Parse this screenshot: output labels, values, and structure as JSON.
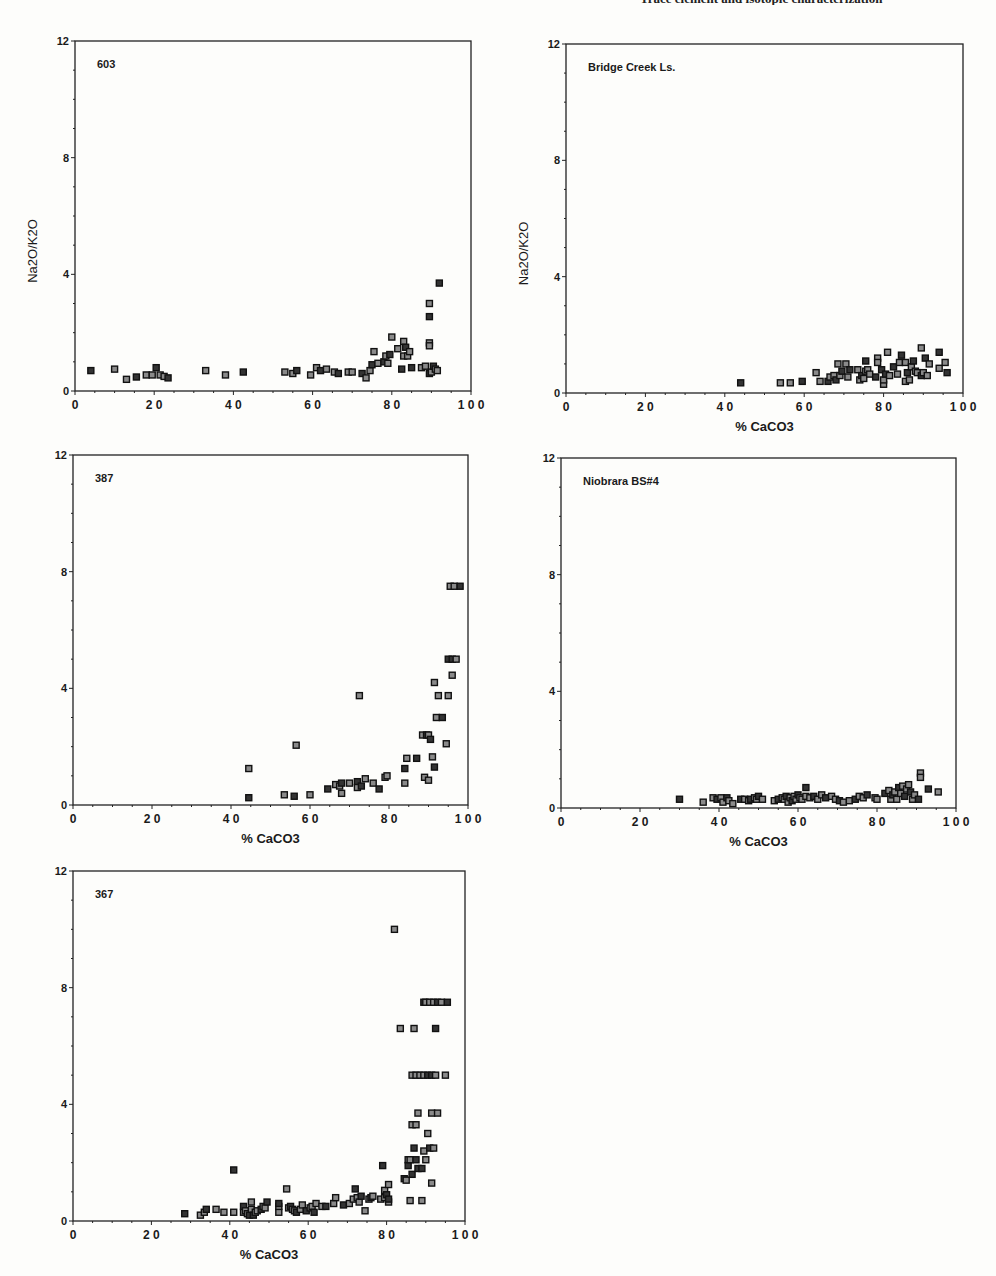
{
  "page": {
    "header_text": "Trace element and isotopic characterization"
  },
  "chart_data": [
    {
      "type": "scatter",
      "id": "plot-603",
      "title": "603",
      "xlabel": "% CaCO3",
      "ylabel": "Na2O/K2O",
      "xlim": [
        0,
        100
      ],
      "ylim": [
        0,
        12
      ],
      "xticks": [
        "0",
        "2 0",
        "4 0",
        "6 0",
        "8 0",
        "1 0 0"
      ],
      "yticks": [
        "0",
        "4",
        "8",
        "12"
      ],
      "show_xlabel": false,
      "show_ylabel": true,
      "box": {
        "left": 75,
        "top": 41,
        "right": 471,
        "bottom": 391
      },
      "points": [
        [
          4,
          0.7
        ],
        [
          10,
          0.75
        ],
        [
          13,
          0.4
        ],
        [
          15.5,
          0.48
        ],
        [
          18,
          0.55
        ],
        [
          19.5,
          0.55
        ],
        [
          20.5,
          0.8
        ],
        [
          21.5,
          0.55
        ],
        [
          22.5,
          0.5
        ],
        [
          23.5,
          0.45
        ],
        [
          33,
          0.7
        ],
        [
          38,
          0.55
        ],
        [
          42.5,
          0.65
        ],
        [
          53,
          0.65
        ],
        [
          55,
          0.6
        ],
        [
          56,
          0.7
        ],
        [
          59.5,
          0.55
        ],
        [
          61,
          0.8
        ],
        [
          62,
          0.7
        ],
        [
          63.5,
          0.75
        ],
        [
          65.5,
          0.65
        ],
        [
          66.5,
          0.6
        ],
        [
          69,
          0.65
        ],
        [
          70,
          0.65
        ],
        [
          72.5,
          0.6
        ],
        [
          73.5,
          0.45
        ],
        [
          74.5,
          0.7
        ],
        [
          75,
          0.9
        ],
        [
          75.5,
          1.35
        ],
        [
          76.5,
          0.95
        ],
        [
          78,
          1.0
        ],
        [
          78.5,
          1.2
        ],
        [
          79,
          0.95
        ],
        [
          79.5,
          1.25
        ],
        [
          80,
          1.85
        ],
        [
          81.5,
          1.45
        ],
        [
          82.5,
          0.75
        ],
        [
          83,
          1.2
        ],
        [
          83,
          1.7
        ],
        [
          83.5,
          1.5
        ],
        [
          84,
          1.2
        ],
        [
          84.5,
          1.35
        ],
        [
          85,
          0.8
        ],
        [
          87.5,
          0.8
        ],
        [
          88.5,
          0.85
        ],
        [
          89.5,
          0.6
        ],
        [
          89.5,
          1.65
        ],
        [
          89.5,
          1.55
        ],
        [
          89.5,
          2.55
        ],
        [
          89.5,
          3.0
        ],
        [
          90,
          0.65
        ],
        [
          90.5,
          0.85
        ],
        [
          91,
          0.75
        ],
        [
          91.5,
          0.7
        ],
        [
          92,
          3.7
        ]
      ]
    },
    {
      "type": "scatter",
      "id": "plot-bridge-creek",
      "title": "Bridge Creek Ls.",
      "xlabel": "% CaCO3",
      "ylabel": "Na2O/K2O",
      "xlim": [
        0,
        100
      ],
      "ylim": [
        0,
        12
      ],
      "xticks": [
        "0",
        "2 0",
        "4 0",
        "6 0",
        "8 0",
        "1 0 0"
      ],
      "yticks": [
        "0",
        "4",
        "8",
        "12"
      ],
      "show_xlabel": true,
      "show_ylabel": true,
      "box": {
        "left": 566,
        "top": 44,
        "right": 963,
        "bottom": 393
      },
      "points": [
        [
          44,
          0.35
        ],
        [
          54,
          0.35
        ],
        [
          56.5,
          0.35
        ],
        [
          59.5,
          0.4
        ],
        [
          63,
          0.7
        ],
        [
          64,
          0.4
        ],
        [
          66,
          0.4
        ],
        [
          66.5,
          0.55
        ],
        [
          67.5,
          0.6
        ],
        [
          68,
          0.45
        ],
        [
          68.5,
          1.0
        ],
        [
          69,
          0.6
        ],
        [
          69.5,
          0.75
        ],
        [
          70.5,
          1.0
        ],
        [
          71,
          0.55
        ],
        [
          71.5,
          0.8
        ],
        [
          73.5,
          0.8
        ],
        [
          74,
          0.45
        ],
        [
          74.5,
          0.6
        ],
        [
          75,
          0.5
        ],
        [
          75.5,
          0.75
        ],
        [
          75.5,
          1.1
        ],
        [
          76,
          0.8
        ],
        [
          76.5,
          0.65
        ],
        [
          78,
          0.55
        ],
        [
          78.5,
          1.2
        ],
        [
          78.5,
          1.05
        ],
        [
          79.5,
          0.8
        ],
        [
          80,
          0.3
        ],
        [
          80,
          0.45
        ],
        [
          80.5,
          0.65
        ],
        [
          81,
          1.4
        ],
        [
          81.5,
          0.6
        ],
        [
          82.5,
          0.9
        ],
        [
          83.5,
          0.65
        ],
        [
          84,
          1.05
        ],
        [
          84.5,
          1.3
        ],
        [
          85.5,
          0.4
        ],
        [
          85.5,
          1.05
        ],
        [
          86,
          0.7
        ],
        [
          86.5,
          0.45
        ],
        [
          87,
          0.9
        ],
        [
          87.5,
          1.1
        ],
        [
          88,
          0.75
        ],
        [
          88.5,
          0.7
        ],
        [
          89.5,
          0.6
        ],
        [
          89.5,
          1.55
        ],
        [
          90,
          0.7
        ],
        [
          90.5,
          1.2
        ],
        [
          91,
          0.6
        ],
        [
          91.5,
          1.0
        ],
        [
          94,
          1.4
        ],
        [
          94,
          0.85
        ],
        [
          95.5,
          1.05
        ],
        [
          96,
          0.7
        ]
      ]
    },
    {
      "type": "scatter",
      "id": "plot-387",
      "title": "387",
      "xlabel": "% CaCO3",
      "ylabel": "",
      "xlim": [
        0,
        100
      ],
      "ylim": [
        0,
        12
      ],
      "xticks": [
        "0",
        "2 0",
        "4 0",
        "6 0",
        "8 0",
        "1 0 0"
      ],
      "yticks": [
        "0",
        "4",
        "8",
        "12"
      ],
      "show_xlabel": true,
      "show_ylabel": false,
      "box": {
        "left": 73,
        "top": 455,
        "right": 468,
        "bottom": 805
      },
      "points": [
        [
          44.5,
          0.25
        ],
        [
          44.5,
          1.25
        ],
        [
          53.5,
          0.35
        ],
        [
          56,
          0.3
        ],
        [
          56.5,
          2.05
        ],
        [
          60,
          0.35
        ],
        [
          64.5,
          0.55
        ],
        [
          66.5,
          0.7
        ],
        [
          67.5,
          0.65
        ],
        [
          68,
          0.75
        ],
        [
          68,
          0.4
        ],
        [
          70,
          0.75
        ],
        [
          72,
          0.8
        ],
        [
          72,
          0.6
        ],
        [
          72.5,
          3.75
        ],
        [
          73,
          0.65
        ],
        [
          74,
          0.9
        ],
        [
          76,
          0.75
        ],
        [
          77.5,
          0.55
        ],
        [
          79,
          0.95
        ],
        [
          79.5,
          1.0
        ],
        [
          84,
          1.25
        ],
        [
          84,
          0.75
        ],
        [
          84.5,
          1.6
        ],
        [
          87,
          1.6
        ],
        [
          88.5,
          2.4
        ],
        [
          89,
          0.95
        ],
        [
          89.5,
          2.4
        ],
        [
          90,
          0.85
        ],
        [
          90,
          2.4
        ],
        [
          90.5,
          2.25
        ],
        [
          91,
          1.65
        ],
        [
          91.5,
          4.2
        ],
        [
          91.5,
          1.3
        ],
        [
          92,
          3.0
        ],
        [
          92.5,
          3.75
        ],
        [
          93.5,
          3.0
        ],
        [
          94.5,
          2.1
        ],
        [
          95,
          3.75
        ],
        [
          95,
          5.0
        ],
        [
          95.5,
          7.5
        ],
        [
          96,
          4.45
        ],
        [
          96,
          5.0
        ],
        [
          96.5,
          7.5
        ],
        [
          97,
          5.0
        ],
        [
          98,
          7.5
        ]
      ]
    },
    {
      "type": "scatter",
      "id": "plot-niobrara",
      "title": "Niobrara BS#4",
      "xlabel": "% CaCO3",
      "ylabel": "",
      "xlim": [
        0,
        100
      ],
      "ylim": [
        0,
        12
      ],
      "xticks": [
        "0",
        "2 0",
        "4 0",
        "6 0",
        "8 0",
        "1 0 0"
      ],
      "yticks": [
        "0",
        "4",
        "8",
        "12"
      ],
      "show_xlabel": true,
      "show_ylabel": false,
      "box": {
        "left": 561,
        "top": 458,
        "right": 956,
        "bottom": 808
      },
      "points": [
        [
          30,
          0.3
        ],
        [
          36,
          0.2
        ],
        [
          38.5,
          0.35
        ],
        [
          39.5,
          0.3
        ],
        [
          40.5,
          0.35
        ],
        [
          41,
          0.2
        ],
        [
          42,
          0.35
        ],
        [
          42.5,
          0.25
        ],
        [
          43.5,
          0.15
        ],
        [
          45.5,
          0.3
        ],
        [
          46.5,
          0.3
        ],
        [
          47.5,
          0.25
        ],
        [
          48,
          0.3
        ],
        [
          49,
          0.35
        ],
        [
          49.5,
          0.3
        ],
        [
          50,
          0.4
        ],
        [
          51,
          0.3
        ],
        [
          54,
          0.25
        ],
        [
          55,
          0.3
        ],
        [
          56,
          0.35
        ],
        [
          56.5,
          0.3
        ],
        [
          57,
          0.4
        ],
        [
          57.5,
          0.2
        ],
        [
          58,
          0.35
        ],
        [
          58.5,
          0.25
        ],
        [
          59,
          0.4
        ],
        [
          59.5,
          0.3
        ],
        [
          60,
          0.45
        ],
        [
          60.5,
          0.35
        ],
        [
          61,
          0.3
        ],
        [
          62,
          0.7
        ],
        [
          62,
          0.4
        ],
        [
          63,
          0.35
        ],
        [
          64,
          0.4
        ],
        [
          65,
          0.3
        ],
        [
          66,
          0.45
        ],
        [
          67,
          0.35
        ],
        [
          68.5,
          0.4
        ],
        [
          69.5,
          0.3
        ],
        [
          70.5,
          0.25
        ],
        [
          71.5,
          0.2
        ],
        [
          73,
          0.25
        ],
        [
          74.5,
          0.3
        ],
        [
          75.5,
          0.4
        ],
        [
          76.5,
          0.35
        ],
        [
          77.5,
          0.45
        ],
        [
          79.5,
          0.35
        ],
        [
          80,
          0.3
        ],
        [
          82,
          0.5
        ],
        [
          83,
          0.6
        ],
        [
          83.5,
          0.3
        ],
        [
          84,
          0.45
        ],
        [
          84.5,
          0.55
        ],
        [
          85,
          0.3
        ],
        [
          85.5,
          0.7
        ],
        [
          86,
          0.5
        ],
        [
          86.5,
          0.75
        ],
        [
          87,
          0.4
        ],
        [
          87.5,
          0.65
        ],
        [
          88,
          0.8
        ],
        [
          88.5,
          0.55
        ],
        [
          89,
          0.3
        ],
        [
          89.5,
          0.45
        ],
        [
          90.5,
          0.3
        ],
        [
          91,
          1.2
        ],
        [
          91,
          1.05
        ],
        [
          93,
          0.65
        ],
        [
          95.5,
          0.55
        ]
      ]
    },
    {
      "type": "scatter",
      "id": "plot-367",
      "title": "367",
      "xlabel": "% CaCO3",
      "ylabel": "",
      "xlim": [
        0,
        100
      ],
      "ylim": [
        0,
        12
      ],
      "xticks": [
        "0",
        "2 0",
        "4 0",
        "6 0",
        "8 0",
        "1 0 0"
      ],
      "yticks": [
        "0",
        "4",
        "8",
        "12"
      ],
      "show_xlabel": true,
      "show_ylabel": false,
      "box": {
        "left": 73,
        "top": 871,
        "right": 465,
        "bottom": 1221
      },
      "points": [
        [
          28.5,
          0.25
        ],
        [
          32.5,
          0.2
        ],
        [
          33.5,
          0.3
        ],
        [
          34,
          0.4
        ],
        [
          36.5,
          0.4
        ],
        [
          38.5,
          0.3
        ],
        [
          41,
          1.75
        ],
        [
          41,
          0.3
        ],
        [
          43.5,
          0.3
        ],
        [
          43.5,
          0.5
        ],
        [
          44,
          0.35
        ],
        [
          44.5,
          0.25
        ],
        [
          45,
          0.2
        ],
        [
          45.5,
          0.4
        ],
        [
          45.5,
          0.65
        ],
        [
          46,
          0.2
        ],
        [
          46.5,
          0.3
        ],
        [
          47,
          0.35
        ],
        [
          48,
          0.4
        ],
        [
          48.5,
          0.5
        ],
        [
          49,
          0.45
        ],
        [
          49.5,
          0.65
        ],
        [
          52.5,
          0.3
        ],
        [
          52.5,
          0.5
        ],
        [
          52.5,
          0.6
        ],
        [
          54.5,
          1.1
        ],
        [
          55,
          0.45
        ],
        [
          55.5,
          0.5
        ],
        [
          56,
          0.4
        ],
        [
          56.5,
          0.35
        ],
        [
          57,
          0.3
        ],
        [
          58,
          0.4
        ],
        [
          58.5,
          0.55
        ],
        [
          59.5,
          0.35
        ],
        [
          60.5,
          0.45
        ],
        [
          61,
          0.5
        ],
        [
          61.5,
          0.3
        ],
        [
          62,
          0.6
        ],
        [
          63.5,
          0.5
        ],
        [
          64.5,
          0.5
        ],
        [
          66.5,
          0.6
        ],
        [
          67,
          0.8
        ],
        [
          69,
          0.55
        ],
        [
          70.5,
          0.6
        ],
        [
          71.5,
          0.75
        ],
        [
          72,
          1.1
        ],
        [
          72.5,
          0.8
        ],
        [
          73,
          0.65
        ],
        [
          73.5,
          0.85
        ],
        [
          74.5,
          0.35
        ],
        [
          75.5,
          0.75
        ],
        [
          76,
          0.8
        ],
        [
          76.5,
          0.85
        ],
        [
          78.5,
          0.75
        ],
        [
          79,
          1.9
        ],
        [
          79.5,
          1.05
        ],
        [
          79.5,
          0.8
        ],
        [
          80,
          0.9
        ],
        [
          80.5,
          1.25
        ],
        [
          80.5,
          0.65
        ],
        [
          80.5,
          0.75
        ],
        [
          82,
          10.0
        ],
        [
          83.5,
          6.6
        ],
        [
          84.5,
          1.45
        ],
        [
          85,
          1.4
        ],
        [
          85.5,
          2.1
        ],
        [
          85.5,
          1.9
        ],
        [
          86,
          0.7
        ],
        [
          86,
          2.1
        ],
        [
          86.5,
          1.6
        ],
        [
          86.5,
          3.3
        ],
        [
          86.5,
          5.0
        ],
        [
          87,
          2.5
        ],
        [
          87,
          6.6
        ],
        [
          87.5,
          3.3
        ],
        [
          87.5,
          2.1
        ],
        [
          87.5,
          5.0
        ],
        [
          88,
          3.7
        ],
        [
          88,
          1.8
        ],
        [
          88.5,
          5.0
        ],
        [
          89,
          0.7
        ],
        [
          89,
          1.8
        ],
        [
          89.5,
          2.4
        ],
        [
          89.5,
          5.0
        ],
        [
          89.5,
          7.5
        ],
        [
          90,
          2.1
        ],
        [
          90,
          7.5
        ],
        [
          90.5,
          5.0
        ],
        [
          90.5,
          3.0
        ],
        [
          91,
          7.5
        ],
        [
          91,
          2.5
        ],
        [
          91.5,
          1.3
        ],
        [
          91.5,
          3.7
        ],
        [
          91.5,
          5.0
        ],
        [
          92,
          2.5
        ],
        [
          92,
          7.5
        ],
        [
          92.5,
          6.6
        ],
        [
          92.5,
          5.0
        ],
        [
          93,
          3.7
        ],
        [
          93,
          7.5
        ],
        [
          94,
          7.5
        ],
        [
          95,
          5.0
        ],
        [
          95.5,
          7.5
        ]
      ]
    }
  ]
}
